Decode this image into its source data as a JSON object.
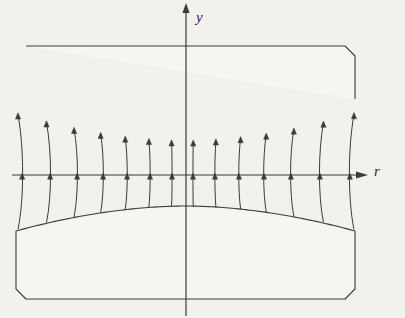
{
  "figure": {
    "type": "technical-diagram",
    "title": "",
    "background_color": "#f3f1ee",
    "line_color": "#3a3a3a",
    "body_fill": "#f7f5f2"
  },
  "axes": {
    "horizontal": {
      "name": "r-axis",
      "label": "r",
      "label_x": 374,
      "label_y": 176,
      "y": 175,
      "x_start": 12,
      "x_end": 358,
      "arrow": "right"
    },
    "vertical": {
      "name": "y-axis",
      "label": "y",
      "label_x": 196,
      "label_y": 22,
      "x": 186,
      "y_start": 10,
      "y_end": 316,
      "arrow": "up"
    },
    "origin": {
      "x": 186,
      "y": 175
    }
  },
  "upper_body": {
    "name": "upper-elastic-body",
    "top": 46,
    "left": 16,
    "right": 355,
    "corner_bevel": 10,
    "edge_y": 113,
    "center_y": 142,
    "shoulder_x_left": 46,
    "shoulder_x_right": 325
  },
  "lower_body": {
    "name": "lower-elastic-body",
    "bottom": 299,
    "left": 16,
    "right": 355,
    "corner_bevel": 10,
    "edge_y": 231,
    "center_y": 206,
    "shoulder_x_left": 46,
    "shoulder_x_right": 325
  },
  "grid": {
    "type": "deformed-mesh",
    "n_vertical_lines": 13,
    "base_x": [
      22,
      50,
      77,
      103,
      127,
      150,
      172,
      193,
      215,
      239,
      264,
      291,
      320,
      350
    ],
    "spread": 0.38,
    "tick_marks": true,
    "tick_row_y": [
      142,
      175,
      206
    ],
    "horizontal_lines": 1
  },
  "chart_data": {
    "type": "line",
    "title": "",
    "xlabel": "r",
    "ylabel": "y",
    "x": [
      -164,
      -136,
      -109,
      -83,
      -59,
      -36,
      -14,
      7,
      29,
      53,
      78,
      105,
      134,
      164
    ],
    "series": [
      {
        "name": "upper-contact-surface",
        "values": [
          -67,
          -45,
          -35,
          -30,
          -27,
          -26,
          -26,
          -26,
          -27,
          -30,
          -35,
          -45,
          -62,
          -67
        ]
      },
      {
        "name": "lower-contact-surface",
        "values": [
          56,
          36,
          29,
          26,
          24,
          23,
          23,
          23,
          24,
          26,
          29,
          36,
          53,
          56
        ]
      },
      {
        "name": "axis-line",
        "values": [
          0,
          0,
          0,
          0,
          0,
          0,
          0,
          0,
          0,
          0,
          0,
          0,
          0,
          0
        ]
      }
    ],
    "xlim": [
      -174,
      172
    ],
    "ylim": [
      -165,
      141
    ],
    "grid": true,
    "legend": "none"
  }
}
